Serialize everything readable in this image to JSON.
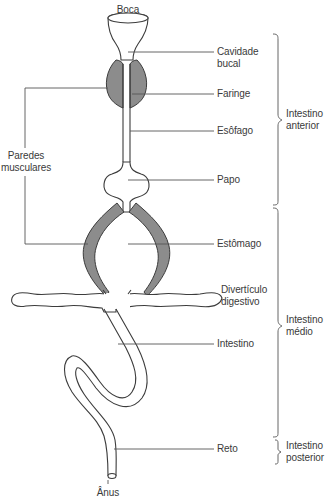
{
  "diagram": {
    "type": "anatomical",
    "top_label": "Boca",
    "bottom_label": "Ânus",
    "structures": [
      {
        "id": "cavidade",
        "label": "Cavidade\nbucal"
      },
      {
        "id": "faringe",
        "label": "Faringe"
      },
      {
        "id": "esofago",
        "label": "Esôfago"
      },
      {
        "id": "papo",
        "label": "Papo"
      },
      {
        "id": "estomago",
        "label": "Estômago"
      },
      {
        "id": "diverticulo",
        "label": "Divertículo\ndigestivo"
      },
      {
        "id": "intestino",
        "label": "Intestino"
      },
      {
        "id": "reto",
        "label": "Reto"
      }
    ],
    "left_label": "Paredes\nmusculares",
    "regions": [
      {
        "id": "anterior",
        "label": "Intestino\nanterior"
      },
      {
        "id": "medio",
        "label": "Intestino\nmédio"
      },
      {
        "id": "posterior",
        "label": "Intestino\nposterior"
      }
    ],
    "colors": {
      "outline": "#3c3c3c",
      "muscle_fill": "#8c8c8c",
      "leader": "#555555",
      "text": "#3a3a3a",
      "background": "#ffffff"
    }
  }
}
